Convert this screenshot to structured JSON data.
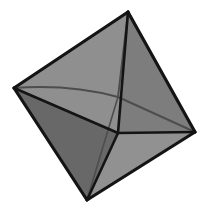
{
  "image": {
    "title": "Octahedron",
    "subject": "shaded-octahedron",
    "width": 209,
    "height": 213,
    "background_color": "#ffffff",
    "edge_color": "#141414",
    "hidden_edge_color": "#4d4d4d"
  },
  "geometry": {
    "vertices": {
      "top": {
        "name": "top-vertex",
        "x": 128,
        "y": 12
      },
      "left": {
        "name": "left-vertex",
        "x": 14,
        "y": 88
      },
      "right": {
        "name": "right-vertex",
        "x": 195,
        "y": 132
      },
      "bottom": {
        "name": "bottom-vertex",
        "x": 87,
        "y": 200
      },
      "front": {
        "name": "front-vertex",
        "x": 118,
        "y": 133
      },
      "back": {
        "name": "back-vertex",
        "x": 118,
        "y": 97
      }
    },
    "outline_points": "128,12 14,88 87,200 195,132",
    "faces": [
      {
        "id": "upper-left-face",
        "points": "128,12 14,88 118,97",
        "color": "#8c8c8c"
      },
      {
        "id": "upper-right-face",
        "points": "128,12 118,97 195,132",
        "color": "#8a8a8a"
      },
      {
        "id": "top-front-face",
        "points": "128,12 14,88 118,133",
        "color": "#8f8f8f"
      },
      {
        "id": "right-front-face",
        "points": "128,12 118,133 195,132",
        "color": "#7d7d7d"
      },
      {
        "id": "lower-left-face",
        "points": "14,88 87,200 118,133",
        "color": "#686868"
      },
      {
        "id": "bottom-right-face",
        "points": "87,200 195,132 118,133",
        "color": "#919191"
      }
    ],
    "visible_edges": [
      {
        "id": "edge-top-left",
        "from": "top",
        "to": "left",
        "d": "M128,12 L14,88",
        "width": 3.2
      },
      {
        "id": "edge-top-right",
        "from": "top",
        "to": "right",
        "d": "M128,12 L195,132",
        "width": 3.2
      },
      {
        "id": "edge-left-bottom",
        "from": "left",
        "to": "bottom",
        "d": "M14,88 L87,200",
        "width": 3.2
      },
      {
        "id": "edge-bottom-right",
        "from": "bottom",
        "to": "right",
        "d": "M87,200 L195,132",
        "width": 3.2
      },
      {
        "id": "edge-top-front",
        "from": "top",
        "to": "front",
        "d": "M128,12 L118,133",
        "width": 2.6
      },
      {
        "id": "edge-left-front",
        "from": "left",
        "to": "front",
        "d": "M14,88 L118,133",
        "width": 2.6
      },
      {
        "id": "edge-front-right",
        "from": "front",
        "to": "right",
        "d": "M118,133 L195,132",
        "width": 2.6
      },
      {
        "id": "edge-front-bottom",
        "from": "front",
        "to": "bottom",
        "d": "M118,133 L87,200",
        "width": 2.6
      }
    ],
    "hidden_edges": [
      {
        "id": "edge-left-back",
        "from": "left",
        "to": "back",
        "d": "M14,88 Q70,84 118,97",
        "width": 2.0
      },
      {
        "id": "edge-back-right",
        "from": "back",
        "to": "right",
        "d": "M118,97 L195,132",
        "width": 2.0
      },
      {
        "id": "edge-top-back",
        "from": "top",
        "to": "back",
        "d": "M128,12 L118,97",
        "width": 2.0
      },
      {
        "id": "edge-back-bottom",
        "from": "back",
        "to": "bottom",
        "d": "M118,97 L87,200",
        "width": 1.6
      }
    ]
  }
}
